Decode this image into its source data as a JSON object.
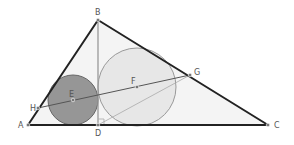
{
  "diagram": {
    "title": "",
    "points": {
      "A": {
        "label": "A",
        "x": 28,
        "y": 125
      },
      "B": {
        "label": "B",
        "x": 98,
        "y": 20
      },
      "C": {
        "label": "C",
        "x": 268,
        "y": 125
      },
      "D": {
        "label": "D",
        "x": 98,
        "y": 125
      },
      "E": {
        "label": "E",
        "x": 73,
        "y": 100
      },
      "F": {
        "label": "F",
        "x": 137,
        "y": 87
      },
      "G": {
        "label": "G",
        "x": 190,
        "y": 75
      },
      "H": {
        "label": "H",
        "x": 38,
        "y": 108
      }
    },
    "circles": [
      {
        "center": "E",
        "r": 25,
        "fill": "#8c8c8c"
      },
      {
        "center": "F",
        "r": 39,
        "fill": "#e4e4e4"
      }
    ],
    "colors": {
      "triangle_fill": "#f4f4f4",
      "triangle_stroke": "#222222",
      "altitude": "#999999",
      "line_HG": "#555555"
    }
  }
}
